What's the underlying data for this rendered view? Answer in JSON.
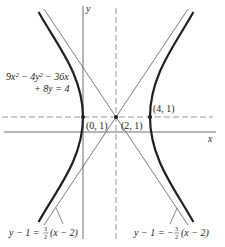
{
  "diagram": {
    "type": "hyperbola-graph",
    "equation": {
      "line1": "9x² − 4y² − 36x",
      "line2": "+ 8y = 4"
    },
    "axes": {
      "x_label": "x",
      "y_label": "y"
    },
    "points": [
      {
        "label": "(0, 1)",
        "role": "left-vertex"
      },
      {
        "label": "(2, 1)",
        "role": "center"
      },
      {
        "label": "(4, 1)",
        "role": "right-vertex"
      }
    ],
    "asymptotes": [
      {
        "label_lhs": "y − 1 = ",
        "frac_num": "3",
        "frac_den": "2",
        "label_rhs": "(x − 2)"
      },
      {
        "label_lhs": "y − 1 = −",
        "frac_num": "3",
        "frac_den": "2",
        "label_rhs": "(x − 2)"
      }
    ],
    "colors": {
      "curve": "#231f20",
      "axis": "#6d6e70",
      "asymptote": "#58595b",
      "dashed": "#939598"
    }
  }
}
